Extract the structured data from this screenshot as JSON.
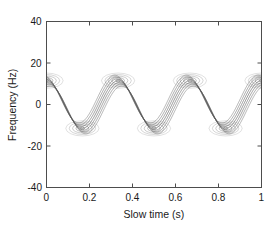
{
  "chart_data": {
    "type": "line",
    "title": "",
    "xlabel": "Slow time (s)",
    "ylabel": "Frequency (Hz)",
    "xlim": [
      0,
      1
    ],
    "ylim": [
      -40,
      40
    ],
    "xticks": [
      0,
      0.2,
      0.4,
      0.6,
      0.8,
      1
    ],
    "xtick_labels": [
      "0",
      "0.2",
      "0.4",
      "0.6",
      "0.8",
      "1"
    ],
    "yticks": [
      -40,
      -20,
      0,
      20,
      40
    ],
    "ytick_labels": [
      "-40",
      "-20",
      "0",
      "20",
      "40"
    ],
    "grid": false,
    "legend": null,
    "modulation": {
      "waveform": "cosine",
      "cycles_over_x_range": 3,
      "modulation_frequency_hz": 3,
      "center_frequency_hz": 0,
      "peak_frequency_hz": 11.5,
      "trough_frequency_hz": -11.5,
      "ridge_band_half_width_hz": 2.6,
      "contour_levels": 7
    },
    "series": [
      {
        "name": "ridge-center",
        "x": [
          0,
          0.05,
          0.1,
          0.15,
          0.2,
          0.25,
          0.3,
          0.35,
          0.4,
          0.45,
          0.5,
          0.55,
          0.6,
          0.65,
          0.7,
          0.75,
          0.8,
          0.85,
          0.9,
          0.95,
          1
        ],
        "values": [
          11.5,
          9.3,
          3.6,
          -3.6,
          -9.3,
          -11.5,
          -9.3,
          -3.6,
          3.6,
          9.3,
          11.5,
          9.3,
          3.6,
          -3.6,
          -9.3,
          -11.5,
          -9.3,
          -3.6,
          3.6,
          9.3,
          11.5
        ]
      },
      {
        "name": "ridge-upper-envelope",
        "x": [
          0,
          0.05,
          0.1,
          0.15,
          0.2,
          0.25,
          0.3,
          0.35,
          0.4,
          0.45,
          0.5,
          0.55,
          0.6,
          0.65,
          0.7,
          0.75,
          0.8,
          0.85,
          0.9,
          0.95,
          1
        ],
        "values": [
          14.1,
          11.9,
          6.2,
          -1.0,
          -6.7,
          -8.9,
          -6.7,
          -1.0,
          6.2,
          11.9,
          14.1,
          11.9,
          6.2,
          -1.0,
          -6.7,
          -8.9,
          -6.7,
          -1.0,
          6.2,
          11.9,
          14.1
        ]
      },
      {
        "name": "ridge-lower-envelope",
        "x": [
          0,
          0.05,
          0.1,
          0.15,
          0.2,
          0.25,
          0.3,
          0.35,
          0.4,
          0.45,
          0.5,
          0.55,
          0.6,
          0.65,
          0.7,
          0.75,
          0.8,
          0.85,
          0.9,
          0.95,
          1
        ],
        "values": [
          8.9,
          6.7,
          1.0,
          -6.2,
          -11.9,
          -14.1,
          -11.9,
          -6.2,
          1.0,
          6.7,
          8.9,
          6.7,
          1.0,
          -6.2,
          -11.9,
          -14.1,
          -11.9,
          -6.2,
          1.0,
          6.7,
          8.9
        ]
      }
    ],
    "crest_markers": [
      {
        "x": 0.0,
        "y": 11.5
      },
      {
        "x": 0.333,
        "y": 11.5
      },
      {
        "x": 0.667,
        "y": 11.5
      },
      {
        "x": 1.0,
        "y": 11.5
      }
    ],
    "trough_markers": [
      {
        "x": 0.167,
        "y": -11.5
      },
      {
        "x": 0.5,
        "y": -11.5
      },
      {
        "x": 0.833,
        "y": -11.5
      }
    ]
  },
  "axes": {
    "line_color": "#4d4d4d",
    "contour_color": "#5a5a5a",
    "background": "#ffffff"
  }
}
